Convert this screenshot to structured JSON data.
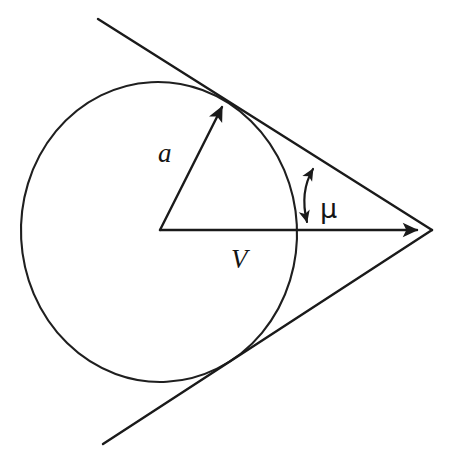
{
  "figure": {
    "type": "geometry-diagram",
    "background_color": "#ffffff",
    "ink_color": "#1a1a1a",
    "width": 454,
    "height": 459
  },
  "labels": {
    "radius_vector": "a",
    "velocity_vector": "V",
    "mach_angle": "μ"
  },
  "label_positions": {
    "radius_vector": {
      "x": 158,
      "y": 162
    },
    "velocity_vector": {
      "x": 231,
      "y": 268
    },
    "mach_angle": {
      "x": 320,
      "y": 218
    }
  },
  "geometry": {
    "circle": {
      "cx": 159,
      "cy": 232,
      "rx": 138,
      "ry": 150
    },
    "cone_apex": {
      "x": 432,
      "y": 230
    },
    "center_point": {
      "x": 160,
      "y": 230
    },
    "radius_arrow_tip": {
      "x": 224,
      "y": 103
    },
    "velocity_arrow_tip": {
      "x": 424,
      "y": 230
    },
    "upper_tangent_start": {
      "x": 98,
      "y": 19
    },
    "upper_tangent_point": {
      "x": 225,
      "y": 100
    },
    "lower_tangent_start": {
      "x": 103,
      "y": 444
    },
    "lower_tangent_point": {
      "x": 225,
      "y": 370
    },
    "angle_arc_top": {
      "x": 315,
      "y": 163
    },
    "angle_arc_bottom": {
      "x": 307,
      "y": 228
    }
  },
  "chart_data": {
    "type": "scatter",
    "xlabel": "",
    "ylabel": "",
    "annotations": [
      "a",
      "V",
      "μ"
    ],
    "series": [
      {
        "name": "sound-wavefront-circle",
        "x": [
          159
        ],
        "y": [
          232
        ],
        "rx": 138,
        "ry": 150
      },
      {
        "name": "radius-vector-a",
        "x": [
          160,
          224
        ],
        "y": [
          230,
          103
        ]
      },
      {
        "name": "velocity-vector-V",
        "x": [
          160,
          424
        ],
        "y": [
          230,
          230
        ]
      },
      {
        "name": "upper-tangent-line",
        "x": [
          98,
          432
        ],
        "y": [
          19,
          230
        ]
      },
      {
        "name": "lower-tangent-line",
        "x": [
          103,
          432
        ],
        "y": [
          444,
          230
        ]
      },
      {
        "name": "mach-angle-arc",
        "x": [
          315,
          307
        ],
        "y": [
          163,
          228
        ]
      }
    ],
    "grid": false,
    "legend": "none"
  }
}
